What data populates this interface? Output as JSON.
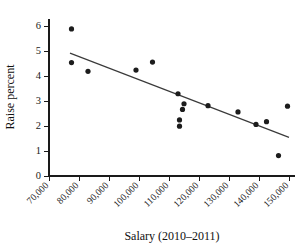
{
  "chart_data": {
    "type": "scatter",
    "title": "",
    "xlabel": "Salary (2010–2011)",
    "ylabel": "Raise percent",
    "xlim": [
      70000,
      152000
    ],
    "ylim": [
      0,
      6.3
    ],
    "grid": false,
    "legend": null,
    "xticks": [
      70000,
      80000,
      90000,
      100000,
      110000,
      120000,
      130000,
      140000,
      150000
    ],
    "xticklabels": [
      "70,000",
      "80,000",
      "90,000",
      "100,000",
      "110,000",
      "120,000",
      "130,000",
      "140,000",
      "150,000"
    ],
    "yticks": [
      0,
      1,
      2,
      3,
      4,
      5,
      6
    ],
    "yticklabels": [
      "0",
      "1",
      "2",
      "3",
      "4",
      "5",
      "6"
    ],
    "xtick_rotation": 45,
    "marker": "filled-circle",
    "marker_color": "#1c1c1c",
    "marker_size": 2.6,
    "points": [
      {
        "x": 77500,
        "y": 5.9
      },
      {
        "x": 77500,
        "y": 4.55
      },
      {
        "x": 83000,
        "y": 4.2
      },
      {
        "x": 99000,
        "y": 4.25
      },
      {
        "x": 104500,
        "y": 4.57
      },
      {
        "x": 113000,
        "y": 3.3
      },
      {
        "x": 113500,
        "y": 2.25
      },
      {
        "x": 113500,
        "y": 2.0
      },
      {
        "x": 114500,
        "y": 2.67
      },
      {
        "x": 115000,
        "y": 2.9
      },
      {
        "x": 123000,
        "y": 2.82
      },
      {
        "x": 133000,
        "y": 2.57
      },
      {
        "x": 139000,
        "y": 2.07
      },
      {
        "x": 142500,
        "y": 2.18
      },
      {
        "x": 146500,
        "y": 0.82
      },
      {
        "x": 149500,
        "y": 2.8
      }
    ],
    "trend_line": {
      "type": "linear-fit",
      "color": "#3a3a3a",
      "x_start": 77000,
      "y_start": 4.93,
      "x_end": 150000,
      "y_end": 1.55
    }
  }
}
